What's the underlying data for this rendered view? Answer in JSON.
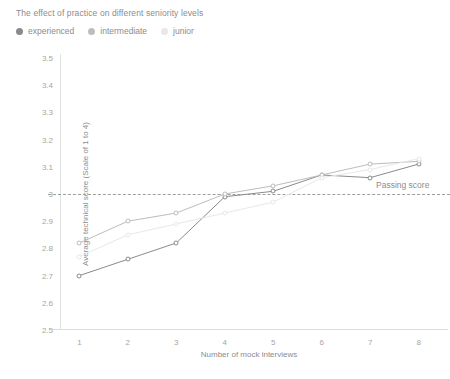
{
  "title": "The effect of practice on different seniority levels",
  "legend": [
    {
      "label": "experienced",
      "color": "#8a8a8a"
    },
    {
      "label": "intermediate",
      "color": "#bdbdbd"
    },
    {
      "label": "junior",
      "color": "#e8e8e8"
    }
  ],
  "threshold": {
    "label": "Passing score",
    "value": 3,
    "color": "#9e9e9e"
  },
  "chart_data": {
    "type": "line",
    "title": "The effect of practice on different seniority levels",
    "xlabel": "Number of mock interviews",
    "ylabel": "Average technical score (Scale of 1 to 4)",
    "x": [
      1,
      2,
      3,
      4,
      5,
      6,
      7,
      8
    ],
    "xticklabels": [
      "1",
      "2",
      "3",
      "4",
      "5",
      "6",
      "7",
      "8"
    ],
    "yticklabels": [
      "2.5",
      "2.6",
      "2.7",
      "2.8",
      "2.9",
      "3",
      "3.1",
      "3.2",
      "3.3",
      "3.4",
      "3.5"
    ],
    "yticks": [
      2.5,
      2.6,
      2.7,
      2.8,
      2.9,
      3.0,
      3.1,
      3.2,
      3.3,
      3.4,
      3.5
    ],
    "ylim": [
      2.5,
      3.5
    ],
    "xlim": [
      0.6,
      8.4
    ],
    "grid": false,
    "legend_position": "top-left",
    "annotations": [
      {
        "text": "Passing score",
        "y": 3,
        "type": "hline-label"
      }
    ],
    "series": [
      {
        "name": "experienced",
        "color": "#8a8a8a",
        "values": [
          2.7,
          2.76,
          2.82,
          2.99,
          3.01,
          3.07,
          3.06,
          3.11
        ]
      },
      {
        "name": "intermediate",
        "color": "#bdbdbd",
        "values": [
          2.82,
          2.9,
          2.93,
          3.0,
          3.03,
          3.07,
          3.11,
          3.12
        ]
      },
      {
        "name": "junior",
        "color": "#e8e8e8",
        "values": [
          2.77,
          2.85,
          2.89,
          2.93,
          2.97,
          3.06,
          3.09,
          3.13
        ]
      }
    ]
  }
}
